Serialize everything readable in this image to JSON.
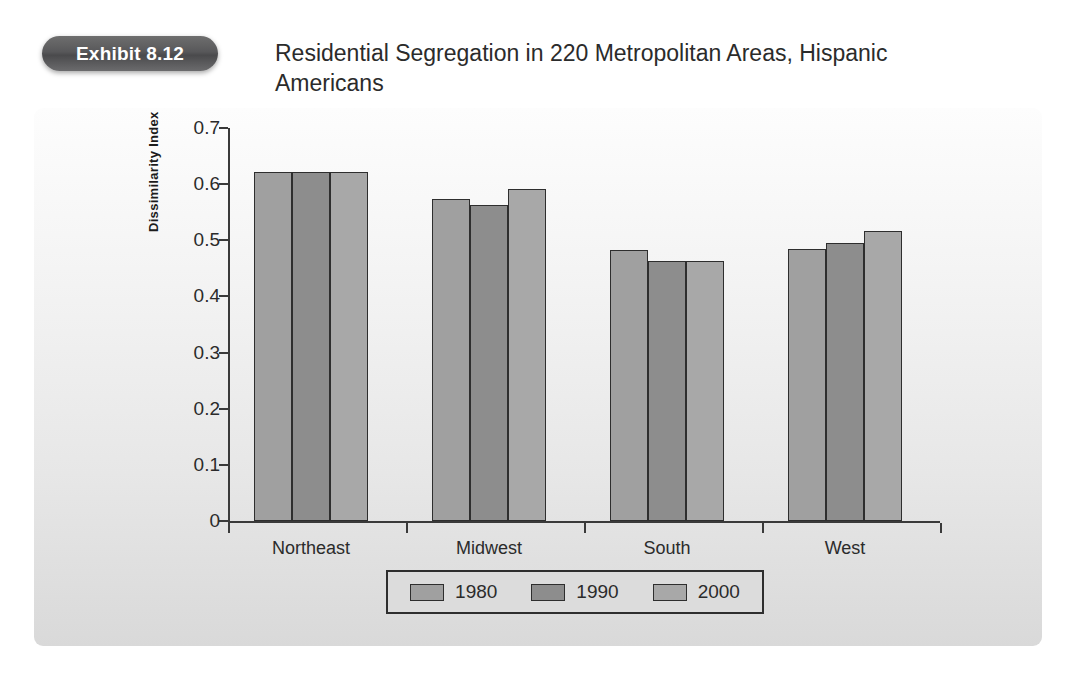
{
  "exhibit": {
    "badge_label": "Exhibit 8.12",
    "title": "Residential Segregation in 220 Metropolitan Areas, Hispanic Americans"
  },
  "colors": {
    "badge_bg": "#58585a",
    "panel_bg_top": "#fdfdfd",
    "panel_bg_bottom": "#d9d9d9",
    "bar_1980": "#a0a0a0",
    "bar_1990": "#8d8d8d",
    "bar_2000": "#a8a8a8",
    "axis": "#3a3a3a",
    "text": "#2b2b2b"
  },
  "chart_data": {
    "type": "bar",
    "title": "Residential Segregation in 220 Metropolitan Areas, Hispanic Americans",
    "xlabel": "",
    "ylabel": "Dissimilarity Index",
    "categories": [
      "Northeast",
      "Midwest",
      "South",
      "West"
    ],
    "series": [
      {
        "name": "1980",
        "values": [
          0.622,
          0.573,
          0.482,
          0.484
        ],
        "color": "#a0a0a0"
      },
      {
        "name": "1990",
        "values": [
          0.622,
          0.563,
          0.464,
          0.495
        ],
        "color": "#8d8d8d"
      },
      {
        "name": "2000",
        "values": [
          0.622,
          0.592,
          0.464,
          0.517
        ],
        "color": "#a8a8a8"
      }
    ],
    "ylim": [
      0,
      0.7
    ],
    "ytick_labels": [
      "0",
      "0.1",
      "0.2",
      "0.3",
      "0.4",
      "0.5",
      "0.6",
      "0.7"
    ],
    "ytick_values": [
      0,
      0.1,
      0.2,
      0.3,
      0.4,
      0.5,
      0.6,
      0.7
    ],
    "grid": false,
    "legend_position": "bottom",
    "legend_entries": [
      "1980",
      "1990",
      "2000"
    ]
  }
}
